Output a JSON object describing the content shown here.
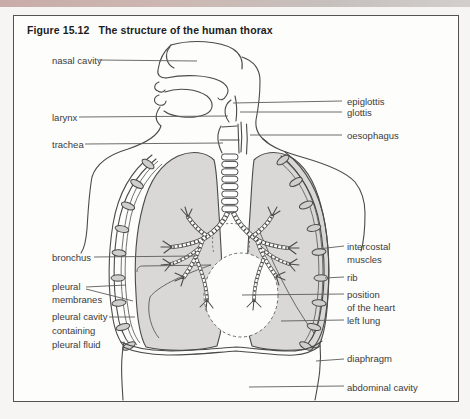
{
  "figure": {
    "number": "Figure 15.12",
    "title": "The structure of the human thorax"
  },
  "labels": {
    "nasal_cavity": "nasal cavity",
    "larynx": "larynx",
    "trachea": "trachea",
    "bronchus": "bronchus",
    "pleural_membranes_1": "pleural",
    "pleural_membranes_2": "membranes",
    "pleural_cavity_1": "pleural cavity",
    "pleural_cavity_2": "containing",
    "pleural_cavity_3": "pleural fluid",
    "epiglottis": "epiglottis",
    "glottis": "glottis",
    "oesophagus": "oesophagus",
    "intercostal_1": "intercostal",
    "intercostal_2": "muscles",
    "rib": "rib",
    "heart_1": "position",
    "heart_2": "of the heart",
    "left_lung": "left lung",
    "diaphragm": "diaphragm",
    "abdominal_cavity": "abdominal cavity"
  },
  "colors": {
    "accent_strip": "#c8aca8",
    "line_art": "#4a4a4a",
    "lung_fill": "#d9d8d6",
    "page_background": "#f6f5f3",
    "figure_background": "#fdfdfc",
    "label_text": "#3b3b3b"
  }
}
